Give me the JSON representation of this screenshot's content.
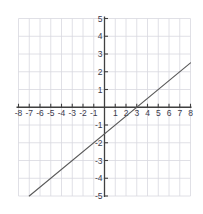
{
  "chart_data": {
    "type": "line",
    "title": "",
    "xlabel": "",
    "ylabel": "",
    "xlim": [
      -8,
      8
    ],
    "ylim": [
      -5,
      5
    ],
    "grid": true,
    "legend": false,
    "x_ticks": [
      -8,
      -7,
      -6,
      -5,
      -4,
      -3,
      -2,
      -1,
      1,
      2,
      3,
      4,
      5,
      6,
      7,
      8
    ],
    "y_ticks": [
      5,
      4,
      3,
      2,
      1,
      -1,
      -2,
      -3,
      -4,
      -5
    ],
    "x_tick_labels": [
      "-8",
      "-7",
      "-6",
      "-5",
      "-4",
      "-3",
      "-2",
      "-1",
      "1",
      "2",
      "3",
      "4",
      "5",
      "6",
      "7",
      "8"
    ],
    "y_tick_labels": [
      "5",
      "4",
      "3",
      "2",
      "1",
      "-1",
      "-2",
      "-3",
      "-4",
      "-5"
    ],
    "series": [
      {
        "name": "line",
        "equation": "y = 0.5x - 1.5",
        "slope": 0.5,
        "y_intercept": -1.5,
        "x_intercept": 3,
        "color": "#5a5a5a",
        "x": [
          -7,
          8
        ],
        "values": [
          -5,
          2.5
        ]
      }
    ],
    "colors": {
      "grid": "#d8d8e0",
      "axis": "#404040",
      "line": "#5a5a5a",
      "label": "#3a3a4c",
      "background": "#ffffff"
    }
  },
  "axes": {
    "x_axis_name": "x-axis",
    "y_axis_name": "y-axis"
  }
}
